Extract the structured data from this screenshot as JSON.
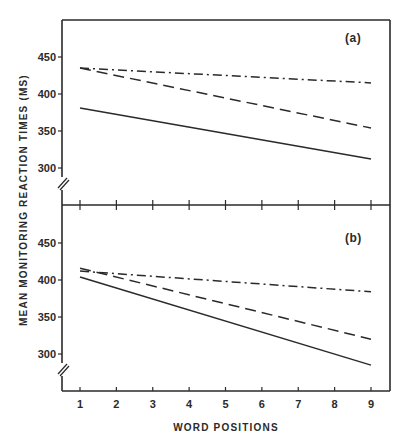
{
  "chart_data": {
    "type": "line",
    "xlabel": "WORD POSITIONS",
    "ylabel": "MEAN MONITORING REACTION TIMES (MS)",
    "x": [
      1,
      9
    ],
    "x_ticks": [
      "1",
      "2",
      "3",
      "4",
      "5",
      "6",
      "7",
      "8",
      "9"
    ],
    "xlim": [
      1,
      9
    ],
    "grid": false,
    "legend": "none",
    "panels": [
      {
        "label": "(a)",
        "ylim": [
          275,
          495
        ],
        "y_ticks": [
          "300",
          "350",
          "400",
          "450"
        ],
        "axis_break": true,
        "series": [
          {
            "name": "dash-dot",
            "style": "dashdot",
            "values": [
              435,
              415
            ]
          },
          {
            "name": "dashed",
            "style": "dashed",
            "values": [
              435,
              354
            ]
          },
          {
            "name": "solid",
            "style": "solid",
            "values": [
              381,
              312
            ]
          }
        ]
      },
      {
        "label": "(b)",
        "ylim": [
          265,
          495
        ],
        "y_ticks": [
          "300",
          "350",
          "400",
          "450"
        ],
        "axis_break": true,
        "series": [
          {
            "name": "dash-dot",
            "style": "dashdot",
            "values": [
              412,
              384
            ]
          },
          {
            "name": "dashed",
            "style": "dashed",
            "values": [
              416,
              320
            ]
          },
          {
            "name": "solid",
            "style": "solid",
            "values": [
              404,
              285
            ]
          }
        ]
      }
    ]
  }
}
